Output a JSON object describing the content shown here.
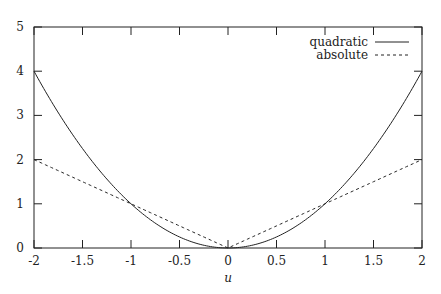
{
  "chart_data": {
    "type": "line",
    "title": "",
    "xlabel": "u",
    "ylabel": "",
    "xlim": [
      -2,
      2
    ],
    "ylim": [
      0,
      5
    ],
    "grid": false,
    "legend_position": "top-right",
    "x_ticks": [
      "-2",
      "-1.5",
      "-1",
      "-0.5",
      "0",
      "0.5",
      "1",
      "1.5",
      "2"
    ],
    "y_ticks": [
      "0",
      "1",
      "2",
      "3",
      "4",
      "5"
    ],
    "series": [
      {
        "name": "quadratic",
        "style": "solid",
        "function": "u^2",
        "x": [
          -2,
          -1.5,
          -1,
          -0.5,
          0,
          0.5,
          1,
          1.5,
          2
        ],
        "values": [
          4,
          2.25,
          1,
          0.25,
          0,
          0.25,
          1,
          2.25,
          4
        ]
      },
      {
        "name": "absolute",
        "style": "dashed",
        "function": "|u|",
        "x": [
          -2,
          -1.5,
          -1,
          -0.5,
          0,
          0.5,
          1,
          1.5,
          2
        ],
        "values": [
          2,
          1.5,
          1,
          0.5,
          0,
          0.5,
          1,
          1.5,
          2
        ]
      }
    ]
  }
}
